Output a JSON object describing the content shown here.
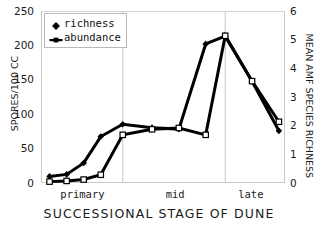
{
  "chart_data": {
    "type": "line",
    "title": "",
    "xlabel": "SUCCESSIONAL STAGE OF DUNE",
    "ylabel": "SPORES/100 CC",
    "ylabel_right": "MEAN AMF SPECIES RICHNESS",
    "categories": [
      "primary",
      "mid",
      "late"
    ],
    "category_positions": [
      0.17,
      0.55,
      0.86
    ],
    "stage_dividers": [
      0.335,
      0.755
    ],
    "ylim": [
      0,
      250
    ],
    "yticks": [
      0,
      50,
      100,
      150,
      200,
      250
    ],
    "ylim_right": [
      0,
      6
    ],
    "yticks_right": [
      0,
      1,
      2,
      3,
      4,
      5,
      6
    ],
    "grid": false,
    "legend_position": "top-left",
    "series": [
      {
        "name": "richness",
        "axis": "right",
        "marker": "filled-diamond",
        "color": "#000000",
        "x": [
          0.035,
          0.105,
          0.175,
          0.245,
          0.335,
          0.455,
          0.565,
          0.675,
          0.755,
          0.865,
          0.975
        ],
        "values": [
          0.23,
          0.3,
          0.7,
          1.62,
          2.05,
          1.93,
          1.88,
          4.85,
          5.12,
          3.55,
          1.82
        ]
      },
      {
        "name": "abundance",
        "axis": "left",
        "marker": "open-square",
        "color": "#000000",
        "x": [
          0.035,
          0.105,
          0.175,
          0.245,
          0.335,
          0.455,
          0.565,
          0.675,
          0.755,
          0.865,
          0.975
        ],
        "values": [
          2,
          3,
          5,
          12,
          70,
          78,
          80,
          70,
          214,
          148,
          89
        ]
      }
    ],
    "legend": [
      {
        "label": "richness",
        "marker": "filled-diamond"
      },
      {
        "label": "abundance",
        "marker": "line-with-marker"
      }
    ]
  },
  "icons": {
    "diamond": "filled-diamond-icon",
    "square": "open-square-icon"
  }
}
